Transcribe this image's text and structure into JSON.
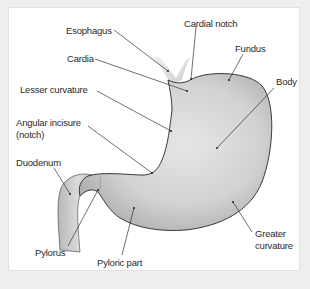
{
  "figure": {
    "labels": {
      "esophagus": "Esophagus",
      "cardial_notch": "Cardial notch",
      "cardia": "Cardia",
      "fundus": "Fundus",
      "body": "Body",
      "lesser_curvature": "Lesser curvature",
      "angular_incisure_line1": "Angular incisure",
      "angular_incisure_line2": "(notch)",
      "duodenum": "Duodenum",
      "pylorus": "Pylorus",
      "pyloric_part": "Pyloric part",
      "greater_curvature_line1": "Greater",
      "greater_curvature_line2": "curvature"
    },
    "colors": {
      "background": "#efefef",
      "panel": "#ffffff",
      "organ_fill": "#d4d4d4",
      "organ_outline": "#3a3a3a",
      "leader_line": "#333333",
      "label_text": "#2a2a2a"
    }
  }
}
